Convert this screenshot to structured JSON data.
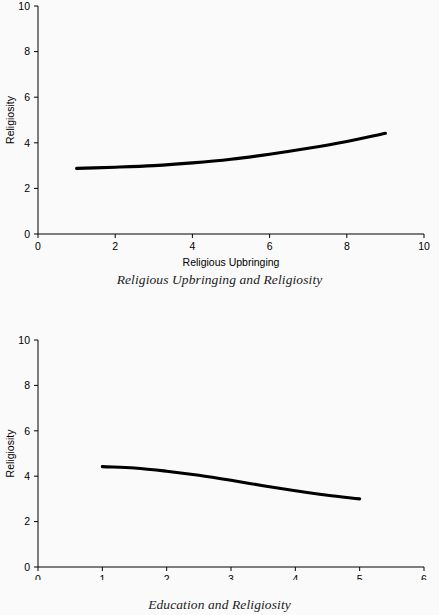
{
  "background_color": "#fafafa",
  "line_color": "#000000",
  "figures": [
    {
      "id": "figure-1",
      "caption": "Religious Upbringing and Religiosity",
      "xlabel": "Religious Upbringing",
      "ylabel": "Religiosity",
      "xticklabels": [
        "0",
        "2",
        "4",
        "6",
        "8",
        "10"
      ],
      "yticklabels": [
        "0",
        "2",
        "4",
        "6",
        "8",
        "10"
      ]
    },
    {
      "id": "figure-2",
      "caption": "Education and Religiosity",
      "xlabel": "Education",
      "ylabel": "Religiosity",
      "xticklabels": [
        "0",
        "1",
        "2",
        "3",
        "4",
        "5",
        "6"
      ],
      "yticklabels": [
        "0",
        "2",
        "4",
        "6",
        "8",
        "10"
      ]
    }
  ],
  "chart_data": [
    {
      "type": "line",
      "title": "Religious Upbringing and Religiosity",
      "xlabel": "Religious Upbringing",
      "ylabel": "Religiosity",
      "xlim": [
        0,
        10
      ],
      "ylim": [
        0,
        10
      ],
      "xticks": [
        0,
        2,
        4,
        6,
        8,
        10
      ],
      "yticks": [
        0,
        2,
        4,
        6,
        8,
        10
      ],
      "grid": false,
      "legend": "none",
      "series": [
        {
          "name": "Religiosity vs Religious Upbringing",
          "x": [
            1,
            2,
            3,
            4,
            5,
            6,
            7,
            8,
            9
          ],
          "values": [
            2.88,
            2.93,
            3.0,
            3.12,
            3.28,
            3.5,
            3.76,
            4.06,
            4.42
          ]
        }
      ]
    },
    {
      "type": "line",
      "title": "Education and Religiosity",
      "xlabel": "Education",
      "ylabel": "Religiosity",
      "xlim": [
        0,
        6
      ],
      "ylim": [
        0,
        10
      ],
      "xticks": [
        0,
        1,
        2,
        3,
        4,
        5,
        6
      ],
      "yticks": [
        0,
        2,
        4,
        6,
        8,
        10
      ],
      "grid": false,
      "legend": "none",
      "series": [
        {
          "name": "Religiosity vs Education",
          "x": [
            1,
            1.5,
            2,
            2.5,
            3,
            3.5,
            4,
            4.5,
            5
          ],
          "values": [
            4.42,
            4.36,
            4.22,
            4.04,
            3.82,
            3.58,
            3.36,
            3.16,
            3.0
          ]
        }
      ]
    }
  ]
}
